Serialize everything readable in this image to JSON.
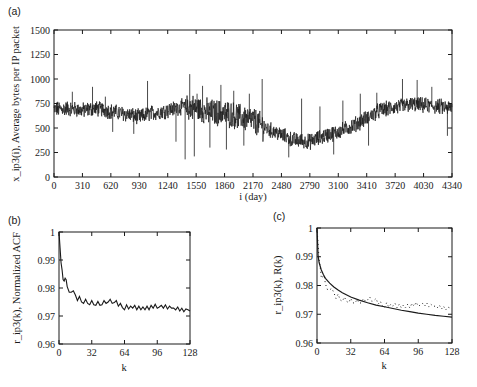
{
  "chart_data": [
    {
      "id": "a",
      "panel_label": "(a)",
      "type": "line",
      "title": "",
      "xlabel": "i (day)",
      "ylabel": "x_ip3(i), Average bytes per IP packet",
      "xlim": [
        0,
        4340
      ],
      "ylim": [
        0,
        1500
      ],
      "xticks": [
        0,
        310,
        620,
        930,
        1240,
        1550,
        1860,
        2170,
        2480,
        2790,
        3100,
        3410,
        3720,
        4030,
        4340
      ],
      "yticks": [
        0,
        250,
        500,
        750,
        1000,
        1250,
        1500
      ],
      "grid": false,
      "series": [
        {
          "name": "x_ip3(i)",
          "color": "#1a1a1a",
          "trend_points": [
            [
              0,
              690
            ],
            [
              150,
              700
            ],
            [
              310,
              680
            ],
            [
              450,
              700
            ],
            [
              620,
              670
            ],
            [
              800,
              640
            ],
            [
              930,
              610
            ],
            [
              1050,
              650
            ],
            [
              1240,
              680
            ],
            [
              1400,
              720
            ],
            [
              1550,
              700
            ],
            [
              1700,
              660
            ],
            [
              1860,
              650
            ],
            [
              2000,
              620
            ],
            [
              2170,
              580
            ],
            [
              2300,
              500
            ],
            [
              2480,
              430
            ],
            [
              2600,
              380
            ],
            [
              2790,
              360
            ],
            [
              2950,
              420
            ],
            [
              3100,
              460
            ],
            [
              3250,
              520
            ],
            [
              3410,
              600
            ],
            [
              3550,
              680
            ],
            [
              3720,
              710
            ],
            [
              3900,
              740
            ],
            [
              4030,
              730
            ],
            [
              4200,
              720
            ],
            [
              4340,
              700
            ]
          ],
          "noise_amplitude": 70,
          "spikes": [
            [
              200,
              870
            ],
            [
              420,
              920
            ],
            [
              560,
              820
            ],
            [
              640,
              460
            ],
            [
              870,
              440
            ],
            [
              1020,
              980
            ],
            [
              1330,
              360
            ],
            [
              1430,
              180
            ],
            [
              1480,
              1050
            ],
            [
              1530,
              210
            ],
            [
              1560,
              850
            ],
            [
              1620,
              930
            ],
            [
              1700,
              300
            ],
            [
              1820,
              940
            ],
            [
              1880,
              280
            ],
            [
              1960,
              880
            ],
            [
              2070,
              320
            ],
            [
              2130,
              850
            ],
            [
              2270,
              1000
            ],
            [
              2560,
              200
            ],
            [
              2700,
              800
            ],
            [
              2900,
              720
            ],
            [
              3050,
              230
            ],
            [
              3150,
              780
            ],
            [
              3340,
              850
            ],
            [
              3430,
              320
            ],
            [
              3520,
              860
            ],
            [
              3800,
              1000
            ],
            [
              3960,
              990
            ],
            [
              4120,
              920
            ],
            [
              4290,
              420
            ]
          ]
        }
      ]
    },
    {
      "id": "b",
      "panel_label": "(b)",
      "type": "line",
      "title": "",
      "xlabel": "k",
      "ylabel": "r_ip3(k), Normalized ACF",
      "xlim": [
        0,
        128
      ],
      "ylim": [
        0.96,
        1
      ],
      "xticks": [
        0,
        32,
        64,
        96,
        128
      ],
      "yticks": [
        0.96,
        0.97,
        0.98,
        0.99,
        1
      ],
      "grid": false,
      "series": [
        {
          "name": "r_ip3(k)",
          "color": "#1a1a1a",
          "points": [
            [
              0,
              1.0
            ],
            [
              1,
              0.9945
            ],
            [
              2,
              0.989
            ],
            [
              3,
              0.9865
            ],
            [
              4,
              0.983
            ],
            [
              5,
              0.9825
            ],
            [
              6,
              0.9835
            ],
            [
              7,
              0.983
            ],
            [
              8,
              0.9805
            ],
            [
              10,
              0.9785
            ],
            [
              12,
              0.9785
            ],
            [
              14,
              0.979
            ],
            [
              16,
              0.9775
            ],
            [
              18,
              0.9755
            ],
            [
              20,
              0.977
            ],
            [
              22,
              0.975
            ],
            [
              24,
              0.9745
            ],
            [
              26,
              0.976
            ],
            [
              28,
              0.9745
            ],
            [
              30,
              0.974
            ],
            [
              32,
              0.9755
            ],
            [
              34,
              0.974
            ],
            [
              36,
              0.9738
            ],
            [
              38,
              0.9752
            ],
            [
              40,
              0.9738
            ],
            [
              42,
              0.974
            ],
            [
              44,
              0.9755
            ],
            [
              46,
              0.9745
            ],
            [
              48,
              0.975
            ],
            [
              50,
              0.976
            ],
            [
              52,
              0.9745
            ],
            [
              54,
              0.9748
            ],
            [
              56,
              0.9755
            ],
            [
              58,
              0.9735
            ],
            [
              60,
              0.9745
            ],
            [
              62,
              0.973
            ],
            [
              64,
              0.9722
            ],
            [
              66,
              0.974
            ],
            [
              68,
              0.9725
            ],
            [
              70,
              0.9735
            ],
            [
              72,
              0.9728
            ],
            [
              74,
              0.9738
            ],
            [
              76,
              0.9722
            ],
            [
              78,
              0.9735
            ],
            [
              80,
              0.9722
            ],
            [
              82,
              0.9732
            ],
            [
              84,
              0.9722
            ],
            [
              86,
              0.9735
            ],
            [
              88,
              0.9722
            ],
            [
              90,
              0.9738
            ],
            [
              92,
              0.9728
            ],
            [
              94,
              0.9742
            ],
            [
              96,
              0.9728
            ],
            [
              98,
              0.9732
            ],
            [
              100,
              0.9738
            ],
            [
              102,
              0.9728
            ],
            [
              104,
              0.974
            ],
            [
              106,
              0.9725
            ],
            [
              108,
              0.9735
            ],
            [
              110,
              0.9728
            ],
            [
              112,
              0.9728
            ],
            [
              114,
              0.9722
            ],
            [
              116,
              0.9732
            ],
            [
              118,
              0.9718
            ],
            [
              120,
              0.9728
            ],
            [
              122,
              0.9715
            ],
            [
              124,
              0.9725
            ],
            [
              126,
              0.9722
            ],
            [
              128,
              0.9718
            ]
          ]
        }
      ]
    },
    {
      "id": "c",
      "panel_label": "(c)",
      "type": "line",
      "title": "",
      "xlabel": "k",
      "ylabel": "r_ip3(k), R(k)",
      "xlim": [
        0,
        128
      ],
      "ylim": [
        0.96,
        1
      ],
      "xticks": [
        0,
        32,
        64,
        96,
        128
      ],
      "yticks": [
        0.96,
        0.97,
        0.98,
        0.99,
        1
      ],
      "grid": false,
      "series": [
        {
          "name": "R(k)",
          "style": "solid",
          "color": "#1a1a1a",
          "points": [
            [
              0,
              1.0
            ],
            [
              1,
              0.9905
            ],
            [
              2,
              0.988
            ],
            [
              4,
              0.9855
            ],
            [
              6,
              0.9838
            ],
            [
              8,
              0.9825
            ],
            [
              12,
              0.9808
            ],
            [
              16,
              0.9795
            ],
            [
              20,
              0.9784
            ],
            [
              24,
              0.9775
            ],
            [
              32,
              0.976
            ],
            [
              40,
              0.9749
            ],
            [
              48,
              0.974
            ],
            [
              56,
              0.9732
            ],
            [
              64,
              0.9726
            ],
            [
              72,
              0.972
            ],
            [
              80,
              0.9714
            ],
            [
              88,
              0.9709
            ],
            [
              96,
              0.9704
            ],
            [
              104,
              0.97
            ],
            [
              112,
              0.9696
            ],
            [
              120,
              0.9693
            ],
            [
              128,
              0.969
            ]
          ]
        },
        {
          "name": "r_ip3(k)",
          "style": "dotted",
          "color": "#1a1a1a",
          "points_ref": "b"
        }
      ]
    }
  ]
}
